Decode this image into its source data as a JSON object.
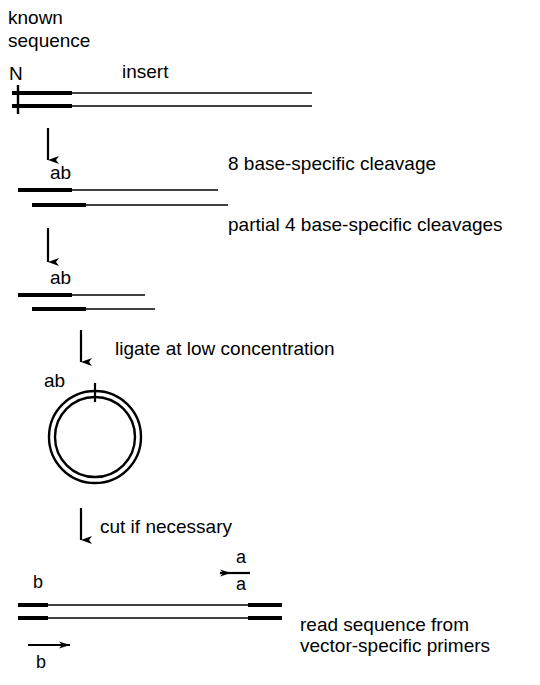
{
  "figure": {
    "title_lines": [
      "known",
      "sequence"
    ],
    "colors": {
      "ink": "#000000",
      "background": "#ffffff"
    }
  },
  "labels": {
    "known_sequence_line1": "known",
    "known_sequence_line2": "sequence",
    "terminus_n": "N",
    "insert": "insert",
    "ab_stage2": "ab",
    "ab_stage3": "ab",
    "ab_circle": "ab",
    "primer_a_top": "a",
    "primer_a_bottom": "a",
    "primer_b_left": "b",
    "primer_b_bottom": "b"
  },
  "steps": [
    {
      "id": "step-cleavage-8",
      "text": "8 base-specific cleavage"
    },
    {
      "id": "step-cleavage-4",
      "text": "partial 4 base-specific cleavages"
    },
    {
      "id": "step-ligate",
      "text": "ligate at low concentration"
    },
    {
      "id": "step-cut",
      "text": "cut if necessary"
    }
  ],
  "readout": {
    "line1": "read sequence from",
    "line2": "vector-specific primers"
  },
  "icons": {
    "down_arrow": "down-arrow-icon",
    "left_arrow": "left-arrow-icon",
    "right_arrow": "right-arrow-icon",
    "circle": "plasmid-circle-icon",
    "tick": "tick-mark-icon"
  },
  "diagram_geometry": {
    "stage1": {
      "top_strand": [
        18,
        93,
        312
      ],
      "bottom_strand": [
        18,
        106,
        312
      ],
      "thick_end": 72
    },
    "stage2": {
      "top_strand": [
        18,
        190,
        218
      ],
      "bottom_strand": [
        32,
        205,
        228
      ],
      "thick_end": 72
    },
    "stage3": {
      "top_strand": [
        18,
        295,
        145
      ],
      "bottom_strand": [
        32,
        309,
        155
      ],
      "thick_end": 72
    },
    "circle": {
      "cx": 95,
      "cy": 437,
      "r_outer": 46,
      "r_inner": 40
    },
    "stage4": {
      "top_strand": [
        18,
        605,
        282
      ],
      "bottom_strand": [
        18,
        618,
        282
      ]
    }
  }
}
